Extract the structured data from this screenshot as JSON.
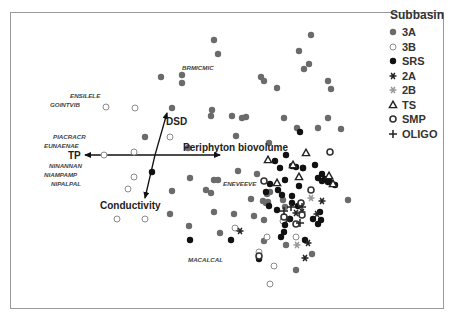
{
  "chart_data": {
    "type": "scatter",
    "title": "",
    "xlabel": "",
    "ylabel": "",
    "grid": false,
    "legend_position": "right",
    "legend": {
      "title": "Subbasin",
      "entries": [
        {
          "key": "3A",
          "label": "3A",
          "marker": "filled-circle",
          "color": "#6b6b6b"
        },
        {
          "key": "3B",
          "label": "3B",
          "marker": "open-circle",
          "color": "#8a8a8a"
        },
        {
          "key": "SRS",
          "label": "SRS",
          "marker": "filled-circle",
          "color": "#111111"
        },
        {
          "key": "2A",
          "label": "2A",
          "marker": "asterisk",
          "color": "#222222"
        },
        {
          "key": "2B",
          "label": "2B",
          "marker": "asterisk",
          "color": "#999999"
        },
        {
          "key": "TS",
          "label": "TS",
          "marker": "open-triangle",
          "color": "#222222"
        },
        {
          "key": "SMP",
          "label": "SMP",
          "marker": "open-circle-bold",
          "color": "#333333"
        },
        {
          "key": "OLIGO",
          "label": "OLIGO",
          "marker": "plus",
          "color": "#222222"
        }
      ]
    },
    "vectors": [
      {
        "label": "TP",
        "from": [
          155,
          155
        ],
        "to": [
          85,
          155
        ]
      },
      {
        "label": "Periphyton biovolume",
        "from": [
          155,
          155
        ],
        "to": [
          220,
          155
        ]
      },
      {
        "label": "DSD",
        "from": [
          155,
          155
        ],
        "to": [
          167,
          113
        ]
      },
      {
        "label": "Conductivity",
        "from": [
          155,
          155
        ],
        "to": [
          145,
          198
        ]
      }
    ],
    "vector_labels": [
      {
        "text": "TP",
        "x": 68,
        "y": 159
      },
      {
        "text": "Periphyton biovolume",
        "x": 183,
        "y": 151
      },
      {
        "text": "DSD",
        "x": 166,
        "y": 125
      },
      {
        "text": "Conductivity",
        "x": 100,
        "y": 209
      }
    ],
    "species_labels": [
      {
        "text": "BRMICMIC",
        "x": 182,
        "y": 70
      },
      {
        "text": "ENSILELE",
        "x": 70,
        "y": 98
      },
      {
        "text": "GOINTVIB",
        "x": 50,
        "y": 107
      },
      {
        "text": "PIACRACR",
        "x": 53,
        "y": 139
      },
      {
        "text": "EUNAENAE",
        "x": 44,
        "y": 148
      },
      {
        "text": "NINANNAN",
        "x": 49,
        "y": 168
      },
      {
        "text": "NIAMPAMP",
        "x": 44,
        "y": 177
      },
      {
        "text": "NIPALPAL",
        "x": 51,
        "y": 186
      },
      {
        "text": "ENEVEEVE",
        "x": 223,
        "y": 186
      },
      {
        "text": "MACALCAL",
        "x": 188,
        "y": 262
      }
    ],
    "points": [
      {
        "g": "3A",
        "x": 214,
        "y": 40
      },
      {
        "g": "3A",
        "x": 218,
        "y": 54
      },
      {
        "g": "3A",
        "x": 182,
        "y": 75
      },
      {
        "g": "3A",
        "x": 182,
        "y": 83
      },
      {
        "g": "3A",
        "x": 172,
        "y": 108
      },
      {
        "g": "3A",
        "x": 161,
        "y": 77
      },
      {
        "g": "3A",
        "x": 261,
        "y": 77
      },
      {
        "g": "3A",
        "x": 264,
        "y": 81
      },
      {
        "g": "3A",
        "x": 277,
        "y": 88
      },
      {
        "g": "3A",
        "x": 311,
        "y": 35
      },
      {
        "g": "3A",
        "x": 299,
        "y": 51
      },
      {
        "g": "3A",
        "x": 309,
        "y": 64
      },
      {
        "g": "3A",
        "x": 304,
        "y": 69
      },
      {
        "g": "3A",
        "x": 328,
        "y": 81
      },
      {
        "g": "3A",
        "x": 331,
        "y": 89
      },
      {
        "g": "3A",
        "x": 145,
        "y": 137
      },
      {
        "g": "3A",
        "x": 212,
        "y": 110
      },
      {
        "g": "3A",
        "x": 211,
        "y": 116
      },
      {
        "g": "3A",
        "x": 232,
        "y": 116
      },
      {
        "g": "3A",
        "x": 246,
        "y": 117
      },
      {
        "g": "3A",
        "x": 242,
        "y": 118
      },
      {
        "g": "3A",
        "x": 284,
        "y": 118
      },
      {
        "g": "3A",
        "x": 297,
        "y": 128
      },
      {
        "g": "3A",
        "x": 328,
        "y": 118
      },
      {
        "g": "3A",
        "x": 341,
        "y": 129
      },
      {
        "g": "3A",
        "x": 188,
        "y": 148
      },
      {
        "g": "3A",
        "x": 236,
        "y": 136
      },
      {
        "g": "3A",
        "x": 269,
        "y": 143
      },
      {
        "g": "3A",
        "x": 318,
        "y": 128
      },
      {
        "g": "3A",
        "x": 214,
        "y": 180
      },
      {
        "g": "3A",
        "x": 218,
        "y": 180
      },
      {
        "g": "3A",
        "x": 238,
        "y": 171
      },
      {
        "g": "3A",
        "x": 257,
        "y": 174
      },
      {
        "g": "3A",
        "x": 211,
        "y": 193
      },
      {
        "g": "3A",
        "x": 190,
        "y": 178
      },
      {
        "g": "3A",
        "x": 206,
        "y": 190
      },
      {
        "g": "3A",
        "x": 172,
        "y": 191
      },
      {
        "g": "3A",
        "x": 267,
        "y": 194
      },
      {
        "g": "3A",
        "x": 268,
        "y": 202
      },
      {
        "g": "3A",
        "x": 283,
        "y": 200
      },
      {
        "g": "3A",
        "x": 270,
        "y": 192
      },
      {
        "g": "3A",
        "x": 251,
        "y": 199
      },
      {
        "g": "3A",
        "x": 234,
        "y": 214
      },
      {
        "g": "3A",
        "x": 348,
        "y": 200
      },
      {
        "g": "3A",
        "x": 170,
        "y": 214
      },
      {
        "g": "3A",
        "x": 189,
        "y": 226
      },
      {
        "g": "3A",
        "x": 220,
        "y": 233
      },
      {
        "g": "3A",
        "x": 264,
        "y": 241
      },
      {
        "g": "3A",
        "x": 285,
        "y": 207
      },
      {
        "g": "3A",
        "x": 266,
        "y": 203
      },
      {
        "g": "3A",
        "x": 263,
        "y": 201
      },
      {
        "g": "3A",
        "x": 296,
        "y": 270
      },
      {
        "g": "3A",
        "x": 312,
        "y": 254
      },
      {
        "g": "3A",
        "x": 286,
        "y": 245
      },
      {
        "g": "3A",
        "x": 214,
        "y": 212
      },
      {
        "g": "3A",
        "x": 254,
        "y": 216
      },
      {
        "g": "3A",
        "x": 264,
        "y": 220
      },
      {
        "g": "3B",
        "x": 106,
        "y": 107
      },
      {
        "g": "3B",
        "x": 135,
        "y": 108
      },
      {
        "g": "3B",
        "x": 170,
        "y": 137
      },
      {
        "g": "3B",
        "x": 104,
        "y": 155
      },
      {
        "g": "3B",
        "x": 134,
        "y": 152
      },
      {
        "g": "3B",
        "x": 134,
        "y": 177
      },
      {
        "g": "3B",
        "x": 128,
        "y": 189
      },
      {
        "g": "3B",
        "x": 145,
        "y": 219
      },
      {
        "g": "3B",
        "x": 117,
        "y": 219
      },
      {
        "g": "3B",
        "x": 283,
        "y": 221
      },
      {
        "g": "3B",
        "x": 259,
        "y": 252
      },
      {
        "g": "3B",
        "x": 270,
        "y": 284
      },
      {
        "g": "3B",
        "x": 274,
        "y": 266
      },
      {
        "g": "3B",
        "x": 267,
        "y": 237
      },
      {
        "g": "3B",
        "x": 296,
        "y": 237
      },
      {
        "g": "3B",
        "x": 235,
        "y": 228
      },
      {
        "g": "SRS",
        "x": 300,
        "y": 132
      },
      {
        "g": "SRS",
        "x": 152,
        "y": 172
      },
      {
        "g": "SRS",
        "x": 286,
        "y": 155
      },
      {
        "g": "SRS",
        "x": 275,
        "y": 161
      },
      {
        "g": "SRS",
        "x": 280,
        "y": 168
      },
      {
        "g": "SRS",
        "x": 292,
        "y": 166
      },
      {
        "g": "SRS",
        "x": 296,
        "y": 167
      },
      {
        "g": "SRS",
        "x": 303,
        "y": 168
      },
      {
        "g": "SRS",
        "x": 315,
        "y": 165
      },
      {
        "g": "SRS",
        "x": 322,
        "y": 174
      },
      {
        "g": "SRS",
        "x": 318,
        "y": 178
      },
      {
        "g": "SRS",
        "x": 325,
        "y": 179
      },
      {
        "g": "SRS",
        "x": 322,
        "y": 181
      },
      {
        "g": "SRS",
        "x": 328,
        "y": 182
      },
      {
        "g": "SRS",
        "x": 330,
        "y": 182
      },
      {
        "g": "SRS",
        "x": 335,
        "y": 185
      },
      {
        "g": "SRS",
        "x": 270,
        "y": 184
      },
      {
        "g": "SRS",
        "x": 285,
        "y": 180
      },
      {
        "g": "SRS",
        "x": 278,
        "y": 190
      },
      {
        "g": "SRS",
        "x": 282,
        "y": 195
      },
      {
        "g": "SRS",
        "x": 299,
        "y": 186
      },
      {
        "g": "SRS",
        "x": 292,
        "y": 196
      },
      {
        "g": "SRS",
        "x": 292,
        "y": 203
      },
      {
        "g": "SRS",
        "x": 298,
        "y": 206
      },
      {
        "g": "SRS",
        "x": 277,
        "y": 210
      },
      {
        "g": "SRS",
        "x": 290,
        "y": 219
      },
      {
        "g": "SRS",
        "x": 269,
        "y": 206
      },
      {
        "g": "SRS",
        "x": 266,
        "y": 192
      },
      {
        "g": "SRS",
        "x": 320,
        "y": 212
      },
      {
        "g": "SRS",
        "x": 313,
        "y": 219
      },
      {
        "g": "SRS",
        "x": 321,
        "y": 220
      },
      {
        "g": "SRS",
        "x": 318,
        "y": 224
      },
      {
        "g": "SRS",
        "x": 285,
        "y": 225
      },
      {
        "g": "SRS",
        "x": 284,
        "y": 232
      },
      {
        "g": "SRS",
        "x": 281,
        "y": 237
      },
      {
        "g": "SRS",
        "x": 305,
        "y": 240
      },
      {
        "g": "SRS",
        "x": 190,
        "y": 240
      },
      {
        "g": "SRS",
        "x": 231,
        "y": 240
      },
      {
        "g": "SRS",
        "x": 259,
        "y": 259
      },
      {
        "g": "SRS",
        "x": 303,
        "y": 168
      },
      {
        "g": "2A",
        "x": 240,
        "y": 231
      },
      {
        "g": "2A",
        "x": 322,
        "y": 201
      },
      {
        "g": "2A",
        "x": 296,
        "y": 213
      },
      {
        "g": "2A",
        "x": 302,
        "y": 212
      },
      {
        "g": "2A",
        "x": 317,
        "y": 214
      },
      {
        "g": "2A",
        "x": 288,
        "y": 219
      },
      {
        "g": "2A",
        "x": 308,
        "y": 243
      },
      {
        "g": "2A",
        "x": 305,
        "y": 258
      },
      {
        "g": "2B",
        "x": 311,
        "y": 198
      },
      {
        "g": "2B",
        "x": 297,
        "y": 245
      },
      {
        "g": "TS",
        "x": 306,
        "y": 153
      },
      {
        "g": "TS",
        "x": 268,
        "y": 160
      },
      {
        "g": "TS",
        "x": 293,
        "y": 165
      },
      {
        "g": "TS",
        "x": 299,
        "y": 177
      },
      {
        "g": "TS",
        "x": 277,
        "y": 183
      },
      {
        "g": "TS",
        "x": 329,
        "y": 176
      },
      {
        "g": "TS",
        "x": 333,
        "y": 184
      },
      {
        "g": "SMP",
        "x": 330,
        "y": 152
      },
      {
        "g": "SMP",
        "x": 264,
        "y": 181
      },
      {
        "g": "SMP",
        "x": 311,
        "y": 190
      },
      {
        "g": "SMP",
        "x": 302,
        "y": 215
      },
      {
        "g": "SMP",
        "x": 284,
        "y": 217
      },
      {
        "g": "SMP",
        "x": 296,
        "y": 224
      },
      {
        "g": "SMP",
        "x": 259,
        "y": 256
      },
      {
        "g": "SMP",
        "x": 301,
        "y": 203
      },
      {
        "g": "OLIGO",
        "x": 291,
        "y": 207
      },
      {
        "g": "OLIGO",
        "x": 302,
        "y": 207
      },
      {
        "g": "OLIGO",
        "x": 284,
        "y": 211
      },
      {
        "g": "OLIGO",
        "x": 300,
        "y": 223
      }
    ],
    "axis_ranges": {
      "x": [
        10,
        444
      ],
      "y": [
        12,
        308
      ]
    }
  },
  "legend_ui": {
    "title": "Subbasin",
    "items": [
      "3A",
      "3B",
      "SRS",
      "2A",
      "2B",
      "TS",
      "SMP",
      "OLIGO"
    ]
  }
}
